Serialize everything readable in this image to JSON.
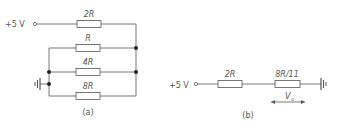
{
  "figure_a": {
    "supply_label": "+5 V",
    "resistors": [
      {
        "label": "2R"
      },
      {
        "label": "R"
      },
      {
        "label": "4R"
      },
      {
        "label": "8R"
      }
    ],
    "caption": "(a)"
  },
  "figure_b": {
    "supply_label": "+5 V",
    "resistors": [
      {
        "label": "2R"
      },
      {
        "label": "8R/11"
      }
    ],
    "output_label": "V",
    "output_subscript": "o",
    "caption": "(b)"
  },
  "colors": {
    "wire": "#555555",
    "resistor_fill": "#ffffff",
    "dot": "#222222",
    "text": "#555555"
  }
}
